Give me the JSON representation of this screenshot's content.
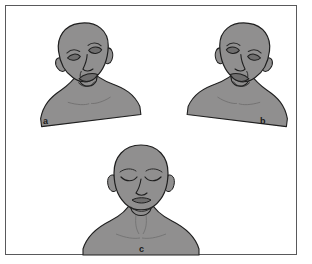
{
  "figure": {
    "caption_panel_type": "medical-illustration-panel",
    "background_color": "#ffffff",
    "border_color": "#59595b",
    "skin_fill": "#908f8f",
    "outline_color": "#1f1f1f",
    "shadow_fill": "#7b7a7a",
    "panels": [
      {
        "id": "a",
        "label": "a",
        "description": "head and bust, head tilted and turned to the subject's left, mouth drawn down on one side"
      },
      {
        "id": "b",
        "label": "b",
        "description": "head and bust, head tilted and turned to the subject's right, mouth drawn down on one side"
      },
      {
        "id": "c",
        "label": "c",
        "description": "head and bust, frontal view, eyes closed, mouth relaxed"
      }
    ]
  }
}
